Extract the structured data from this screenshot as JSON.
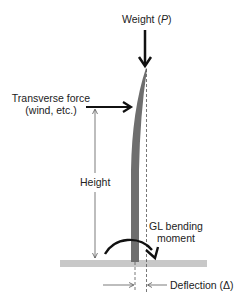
{
  "diagram": {
    "type": "structural-loading-diagram",
    "labels": {
      "weight": "Weight (",
      "weight_symbol": "P",
      "weight_close": ")",
      "transverse_line1": "Transverse force",
      "transverse_line2": "(wind, etc.)",
      "height": "Height",
      "moment_line1": "GL bending",
      "moment_line2": "moment",
      "deflection": "Deflection (Δ)"
    },
    "colors": {
      "pole": "#6e6e6e",
      "ground": "#c8c8c8",
      "arrow": "#111111",
      "thin_line": "#444444",
      "text": "#222222"
    },
    "elements": [
      {
        "name": "weight-arrow",
        "direction": "down"
      },
      {
        "name": "transverse-force-arrow",
        "direction": "right"
      },
      {
        "name": "height-dimension",
        "direction": "vertical"
      },
      {
        "name": "bending-moment-arc",
        "direction": "clockwise"
      },
      {
        "name": "deflection-dimension",
        "direction": "horizontal"
      },
      {
        "name": "pole",
        "state": "deflected"
      },
      {
        "name": "ground-line"
      }
    ]
  }
}
